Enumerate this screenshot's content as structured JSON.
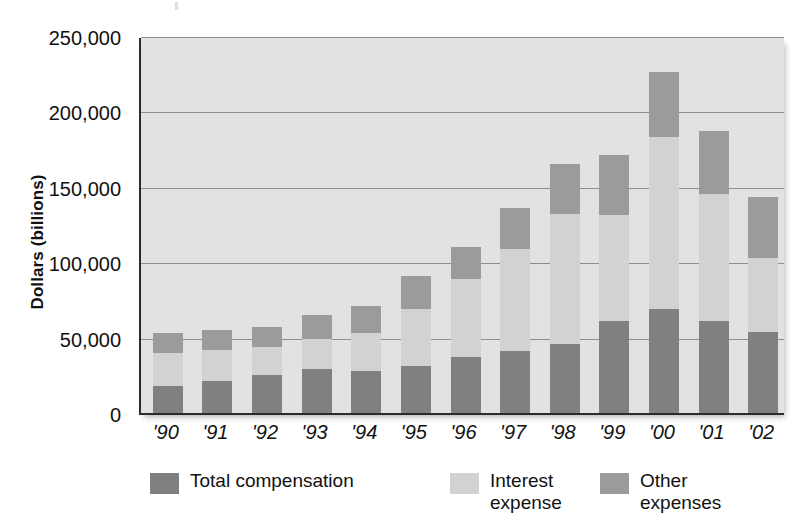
{
  "chart_data": {
    "type": "bar",
    "subtype": "stacked-bar",
    "title": "",
    "subtitle": "",
    "xlabel": "",
    "ylabel": "Dollars (billions)",
    "categories": [
      "'90",
      "'91",
      "'92",
      "'93",
      "'94",
      "'95",
      "'96",
      "'97",
      "'98",
      "'99",
      "'00",
      "'01",
      "'02"
    ],
    "ylim": [
      0,
      250000
    ],
    "ytick_values": [
      0,
      50000,
      100000,
      150000,
      200000,
      250000
    ],
    "ytick_labels": [
      "0",
      "50,000",
      "100,000",
      "150,000",
      "200,000",
      "250,000"
    ],
    "grid": true,
    "grid_axis": "y",
    "legend_position": "bottom",
    "series": [
      {
        "name": "Total compensation",
        "color": "#808080",
        "values": [
          18000,
          21000,
          25000,
          29000,
          28000,
          31000,
          37000,
          41000,
          46000,
          61000,
          69000,
          61000,
          54000
        ]
      },
      {
        "name": "Interest expense",
        "color": "#d2d2d0",
        "values": [
          22000,
          21000,
          19000,
          20000,
          25000,
          38000,
          52000,
          68000,
          86000,
          70000,
          114000,
          84000,
          49000
        ]
      },
      {
        "name": "Other expenses",
        "color": "#9b9b9b",
        "values": [
          13000,
          13000,
          13000,
          16000,
          18000,
          22000,
          21000,
          27000,
          33000,
          40000,
          43000,
          42000,
          40000
        ]
      }
    ],
    "totals": [
      53000,
      55000,
      57000,
      65000,
      71000,
      91000,
      110000,
      136000,
      165000,
      171000,
      226000,
      187000,
      143000
    ]
  },
  "legend": {
    "items": [
      {
        "label": "Total compensation",
        "color": "#808080"
      },
      {
        "label": "Interest\nexpense",
        "color": "#d2d2d0"
      },
      {
        "label": "Other\nexpenses",
        "color": "#9b9b9b"
      }
    ]
  },
  "colors": {
    "plot_background": "#e2e2e0",
    "gridline": "#8d8d8d",
    "axis": "#2b2b2b",
    "page_background": "#ffffff",
    "text": "#111111"
  }
}
